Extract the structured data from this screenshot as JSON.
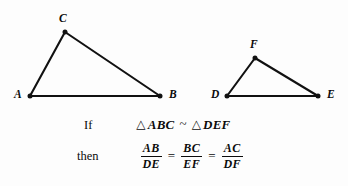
{
  "figure": {
    "caption_lines": {
      "if_keyword": "If",
      "then_keyword": "then"
    },
    "similarity_statement": {
      "triangle_glyph": "△",
      "left_triangle": "ABC",
      "relation_symbol": "~",
      "right_triangle": "DEF"
    },
    "proportion": {
      "equals_symbol": "=",
      "fractions": [
        {
          "numerator": "AB",
          "denominator": "DE"
        },
        {
          "numerator": "BC",
          "denominator": "EF"
        },
        {
          "numerator": "AC",
          "denominator": "DF"
        }
      ]
    },
    "triangles": [
      {
        "name": "triangle-abc",
        "vertices": [
          {
            "label": "A",
            "x": 30,
            "y": 96,
            "label_x": 14,
            "label_y": 89
          },
          {
            "label": "B",
            "x": 160,
            "y": 96,
            "label_x": 169,
            "label_y": 89
          },
          {
            "label": "C",
            "x": 65,
            "y": 32,
            "label_x": 59,
            "label_y": 13
          }
        ]
      },
      {
        "name": "triangle-def",
        "vertices": [
          {
            "label": "D",
            "x": 227,
            "y": 96,
            "label_x": 211,
            "label_y": 89
          },
          {
            "label": "E",
            "x": 318,
            "y": 96,
            "label_x": 327,
            "label_y": 89
          },
          {
            "label": "F",
            "x": 255,
            "y": 58,
            "label_x": 250,
            "label_y": 39
          }
        ]
      }
    ],
    "colors": {
      "stroke": "#111111",
      "text": "#0b0b0b",
      "background": "#fdfdfd"
    }
  }
}
